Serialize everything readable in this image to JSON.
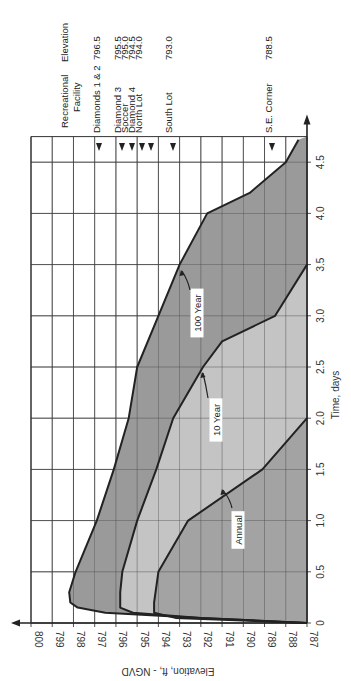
{
  "chart_data": {
    "type": "area",
    "orientation_note": "figure rotated 90 degrees; time axis runs bottom-to-top on right, elevation axis runs left-to-right along bottom",
    "xlabel": "Time, days",
    "ylabel": "Elevation, ft, - NGVD",
    "xlim": [
      0,
      4.75
    ],
    "ylim": [
      787,
      800
    ],
    "x_ticks": [
      "0",
      "0.5",
      "1.0",
      "1.5",
      "2.0",
      "2.5",
      "3.0",
      "3.5",
      "4.0",
      "4.5"
    ],
    "x_tick_values": [
      0,
      0.5,
      1.0,
      1.5,
      2.0,
      2.5,
      3.0,
      3.5,
      4.0,
      4.5
    ],
    "y_ticks": [
      "800",
      "799",
      "798",
      "797",
      "796",
      "795",
      "794",
      "793",
      "792",
      "791",
      "790",
      "789",
      "788",
      "787"
    ],
    "y_tick_values": [
      800,
      799,
      798,
      797,
      796,
      795,
      794,
      793,
      792,
      791,
      790,
      789,
      788,
      787
    ],
    "grid": true,
    "series": [
      {
        "name": "100 Year",
        "fill": "#9a9a9a",
        "x": [
          0,
          0.05,
          0.1,
          0.15,
          0.2,
          0.3,
          0.5,
          1.0,
          1.5,
          2.0,
          2.5,
          3.0,
          3.5,
          4.0,
          4.2,
          4.5,
          4.72
        ],
        "values": [
          787,
          792,
          796.5,
          797.8,
          798.15,
          798.2,
          797.9,
          796.9,
          796.1,
          795.4,
          795.0,
          794.0,
          793.0,
          791.7,
          789.7,
          788.0,
          787.4
        ]
      },
      {
        "name": "10 Year",
        "fill": "#c4c4c4",
        "x": [
          0,
          0.05,
          0.1,
          0.15,
          0.3,
          0.5,
          1.0,
          1.5,
          2.0,
          2.5,
          2.75,
          3.0,
          3.5
        ],
        "values": [
          787,
          792,
          795.2,
          795.8,
          795.8,
          795.7,
          795.0,
          794.1,
          793.3,
          791.9,
          791.0,
          788.5,
          787.0
        ]
      },
      {
        "name": "Annual",
        "fill": "#a3a3a3",
        "x": [
          0,
          0.05,
          0.1,
          0.2,
          0.5,
          1.0,
          1.5,
          2.0
        ],
        "values": [
          787,
          793.2,
          794.2,
          794.2,
          794.0,
          792.6,
          789.1,
          787.0
        ]
      }
    ],
    "annotations": [
      {
        "text": "100 Year",
        "t": 2.95,
        "elev": 792.2
      },
      {
        "text": "10 Year",
        "t": 1.98,
        "elev": 791.6
      },
      {
        "text": "Annual",
        "t": 0.9,
        "elev": 790.4
      }
    ],
    "reference_table": {
      "header_facility": "Recreational Facility",
      "header_facility_line1": "Recreational",
      "header_facility_line2": "Facility",
      "header_elevation": "Elevation",
      "rows": [
        {
          "facility": "Diamonds 1 & 2",
          "elevation": "796.5"
        },
        {
          "facility": "Diamond  3",
          "elevation": "795.5"
        },
        {
          "facility": "Soccer",
          "elevation": "795.0"
        },
        {
          "facility": "Diamond  4",
          "elevation": "794.5"
        },
        {
          "facility": "North Lot",
          "elevation": "794.0"
        },
        {
          "facility": "South Lot",
          "elevation": "793.0"
        },
        {
          "facility": "S.E. Corner",
          "elevation": "788.5"
        }
      ]
    }
  }
}
